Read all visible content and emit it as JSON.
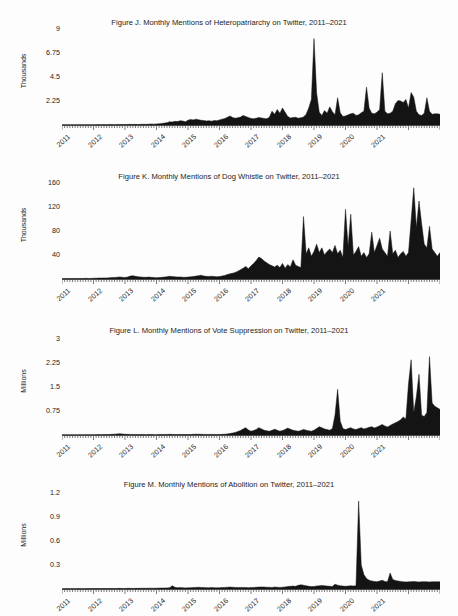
{
  "page": {
    "background": "#fdfdfd",
    "ink": "#1a1a1a",
    "series_fill": "#141414"
  },
  "figures": [
    {
      "id": "figure-j",
      "title": "Figure J. Monthly Mentions of Heteropatriarchy on Twitter, 2011–2021",
      "ylabel": "Thousands",
      "yticks": [
        "9",
        "6.75",
        "4.5",
        "2.25"
      ],
      "xticks": [
        "2011",
        "2012",
        "2013",
        "2014",
        "2015",
        "2016",
        "2017",
        "2018",
        "2019",
        "2020",
        "2021"
      ]
    },
    {
      "id": "figure-k",
      "title": "Figure K. Monthly Mentions of Dog Whistle on Twitter, 2011–2021",
      "ylabel": "Thousands",
      "yticks": [
        "160",
        "120",
        "80",
        "40"
      ],
      "xticks": [
        "2011",
        "2012",
        "2013",
        "2014",
        "2015",
        "2016",
        "2017",
        "2018",
        "2019",
        "2020",
        "2021"
      ]
    },
    {
      "id": "figure-l",
      "title": "Figure L. Monthly Mentions of Vote Suppression on Twitter, 2011–2021",
      "ylabel": "Millions",
      "yticks": [
        "3",
        "2.25",
        "1.5",
        "0.75"
      ],
      "xticks": [
        "2011",
        "2012",
        "2013",
        "2014",
        "2015",
        "2016",
        "2017",
        "2018",
        "2019",
        "2020",
        "2021"
      ]
    },
    {
      "id": "figure-m",
      "title": "Figure M. Monthly Mentions of Abolition on Twitter, 2011–2021",
      "ylabel": "Millions",
      "yticks": [
        "1.2",
        "0.9",
        "0.6",
        "0.3"
      ],
      "xticks": [
        "2011",
        "2012",
        "2013",
        "2014",
        "2015",
        "2016",
        "2017",
        "2018",
        "2019",
        "2020",
        "2021"
      ]
    }
  ],
  "chart_data": [
    {
      "type": "area",
      "title": "Figure J. Monthly Mentions of Heteropatriarchy on Twitter, 2011–2021",
      "xlabel": "",
      "ylabel": "Thousands",
      "ylim": [
        0,
        9
      ],
      "yticks": [
        2.25,
        4.5,
        6.75,
        9
      ],
      "grid": false,
      "legend": "none",
      "x_start": "2011-01",
      "x_end": "2021-08",
      "x_tick_labels": [
        "2011",
        "2012",
        "2013",
        "2014",
        "2015",
        "2016",
        "2017",
        "2018",
        "2019",
        "2020",
        "2021"
      ],
      "units": "thousands of mentions per month",
      "values": [
        0.02,
        0.02,
        0.03,
        0.02,
        0.03,
        0.02,
        0.03,
        0.03,
        0.02,
        0.03,
        0.03,
        0.02,
        0.03,
        0.03,
        0.04,
        0.03,
        0.04,
        0.03,
        0.04,
        0.04,
        0.03,
        0.04,
        0.05,
        0.04,
        0.05,
        0.05,
        0.06,
        0.05,
        0.06,
        0.05,
        0.06,
        0.07,
        0.06,
        0.08,
        0.09,
        0.08,
        0.1,
        0.12,
        0.14,
        0.18,
        0.22,
        0.3,
        0.28,
        0.34,
        0.32,
        0.4,
        0.38,
        0.3,
        0.45,
        0.52,
        0.48,
        0.55,
        0.5,
        0.44,
        0.42,
        0.38,
        0.4,
        0.36,
        0.42,
        0.4,
        0.48,
        0.55,
        0.6,
        0.72,
        0.85,
        0.7,
        0.64,
        0.68,
        0.74,
        0.9,
        0.8,
        0.7,
        0.62,
        0.58,
        0.64,
        0.7,
        0.66,
        0.62,
        0.58,
        0.72,
        1.3,
        1.0,
        1.45,
        1.1,
        1.6,
        1.2,
        0.8,
        0.66,
        0.7,
        0.72,
        0.64,
        0.68,
        0.74,
        1.0,
        1.6,
        2.4,
        8.1,
        3.0,
        1.2,
        0.9,
        1.35,
        1.1,
        1.7,
        1.25,
        0.95,
        2.55,
        1.15,
        0.8,
        0.85,
        0.95,
        1.05,
        1.1,
        0.9,
        0.95,
        1.15,
        1.3,
        3.55,
        1.6,
        1.1,
        1.05,
        1.2,
        1.45,
        4.9,
        1.3,
        1.05,
        1.1,
        1.3,
        2.0,
        2.3,
        2.25,
        2.1,
        2.4,
        1.6,
        3.05,
        2.6,
        1.3,
        0.95,
        0.9,
        1.1,
        2.55,
        1.3,
        1.0,
        1.05,
        1.05,
        1.0
      ]
    },
    {
      "type": "area",
      "title": "Figure K. Monthly Mentions of Dog Whistle on Twitter, 2011–2021",
      "xlabel": "",
      "ylabel": "Thousands",
      "ylim": [
        0,
        160
      ],
      "yticks": [
        40,
        80,
        120,
        160
      ],
      "grid": false,
      "legend": "none",
      "x_start": "2011-01",
      "x_end": "2021-08",
      "x_tick_labels": [
        "2011",
        "2012",
        "2013",
        "2014",
        "2015",
        "2016",
        "2017",
        "2018",
        "2019",
        "2020",
        "2021"
      ],
      "units": "thousands of mentions per month",
      "values": [
        0.6,
        0.7,
        0.8,
        0.7,
        0.9,
        0.8,
        0.9,
        1.0,
        0.9,
        1.1,
        1.0,
        0.9,
        1.2,
        1.4,
        1.6,
        1.5,
        1.8,
        1.6,
        2.0,
        2.4,
        2.6,
        3.0,
        3.4,
        2.8,
        2.6,
        3.2,
        4.8,
        5.6,
        4.4,
        3.8,
        3.4,
        3.0,
        2.8,
        3.2,
        2.8,
        2.4,
        2.2,
        2.4,
        2.8,
        3.2,
        3.8,
        4.6,
        4.0,
        3.6,
        3.2,
        3.4,
        3.0,
        2.8,
        3.2,
        3.6,
        4.2,
        4.8,
        5.6,
        6.2,
        5.0,
        4.4,
        4.2,
        4.6,
        4.2,
        3.8,
        4.2,
        5.0,
        6.0,
        7.4,
        8.6,
        9.6,
        11.0,
        13.0,
        15.5,
        18.0,
        21.0,
        17.0,
        22.0,
        26.0,
        31.0,
        36.5,
        34.0,
        30.0,
        27.0,
        24.0,
        22.0,
        20.0,
        23.0,
        19.0,
        26.0,
        18.0,
        24.0,
        20.0,
        32.0,
        23.0,
        21.0,
        19.0,
        104.0,
        42.0,
        52.0,
        38.0,
        46.0,
        58.0,
        44.0,
        52.0,
        40.0,
        46.0,
        50.0,
        44.0,
        56.0,
        42.0,
        48.0,
        36.0,
        116.0,
        54.0,
        108.0,
        40.0,
        46.0,
        54.0,
        38.0,
        44.0,
        36.0,
        42.0,
        78.0,
        44.0,
        56.0,
        68.0,
        50.0,
        44.0,
        38.0,
        80.0,
        42.0,
        48.0,
        36.0,
        42.0,
        46.0,
        38.0,
        44.0,
        98.0,
        152.0,
        86.0,
        130.0,
        92.0,
        58.0,
        52.0,
        88.0,
        50.0,
        44.0,
        38.0,
        44.0
      ]
    },
    {
      "type": "area",
      "title": "Figure L. Monthly Mentions of Vote Suppression on Twitter, 2011–2021",
      "xlabel": "",
      "ylabel": "Millions",
      "ylim": [
        0,
        3
      ],
      "yticks": [
        0.75,
        1.5,
        2.25,
        3
      ],
      "grid": false,
      "legend": "none",
      "x_start": "2011-01",
      "x_end": "2021-08",
      "x_tick_labels": [
        "2011",
        "2012",
        "2013",
        "2014",
        "2015",
        "2016",
        "2017",
        "2018",
        "2019",
        "2020",
        "2021"
      ],
      "units": "millions of mentions per month",
      "values": [
        0.004,
        0.005,
        0.006,
        0.005,
        0.006,
        0.005,
        0.006,
        0.007,
        0.006,
        0.008,
        0.009,
        0.007,
        0.008,
        0.01,
        0.012,
        0.011,
        0.013,
        0.012,
        0.016,
        0.02,
        0.026,
        0.034,
        0.04,
        0.03,
        0.024,
        0.02,
        0.018,
        0.016,
        0.014,
        0.013,
        0.012,
        0.012,
        0.011,
        0.014,
        0.012,
        0.01,
        0.011,
        0.012,
        0.014,
        0.016,
        0.018,
        0.02,
        0.017,
        0.015,
        0.014,
        0.016,
        0.014,
        0.012,
        0.014,
        0.016,
        0.02,
        0.026,
        0.024,
        0.021,
        0.019,
        0.018,
        0.016,
        0.018,
        0.016,
        0.014,
        0.016,
        0.02,
        0.026,
        0.034,
        0.046,
        0.06,
        0.08,
        0.11,
        0.14,
        0.19,
        0.23,
        0.16,
        0.12,
        0.14,
        0.175,
        0.23,
        0.19,
        0.15,
        0.13,
        0.12,
        0.145,
        0.18,
        0.15,
        0.12,
        0.14,
        0.175,
        0.215,
        0.18,
        0.15,
        0.13,
        0.12,
        0.14,
        0.175,
        0.15,
        0.13,
        0.12,
        0.15,
        0.2,
        0.26,
        0.23,
        0.19,
        0.17,
        0.15,
        0.2,
        0.62,
        1.43,
        0.43,
        0.2,
        0.17,
        0.2,
        0.23,
        0.19,
        0.17,
        0.2,
        0.23,
        0.19,
        0.21,
        0.24,
        0.26,
        0.22,
        0.25,
        0.29,
        0.33,
        0.28,
        0.25,
        0.3,
        0.34,
        0.38,
        0.42,
        0.48,
        0.56,
        0.5,
        1.6,
        2.35,
        0.7,
        1.2,
        1.9,
        0.62,
        0.58,
        0.7,
        2.45,
        1.0,
        0.9,
        0.85,
        0.8
      ]
    },
    {
      "type": "area",
      "title": "Figure M. Monthly Mentions of Abolition on Twitter, 2011–2021",
      "xlabel": "",
      "ylabel": "Millions",
      "ylim": [
        0,
        1.2
      ],
      "yticks": [
        0.3,
        0.6,
        0.9,
        1.2
      ],
      "grid": false,
      "legend": "none",
      "x_start": "2011-01",
      "x_end": "2021-08",
      "x_tick_labels": [
        "2011",
        "2012",
        "2013",
        "2014",
        "2015",
        "2016",
        "2017",
        "2018",
        "2019",
        "2020",
        "2021"
      ],
      "units": "millions of mentions per month",
      "values": [
        0.004,
        0.004,
        0.005,
        0.004,
        0.005,
        0.004,
        0.005,
        0.005,
        0.004,
        0.005,
        0.006,
        0.005,
        0.005,
        0.006,
        0.006,
        0.005,
        0.006,
        0.006,
        0.007,
        0.007,
        0.006,
        0.007,
        0.008,
        0.006,
        0.007,
        0.008,
        0.008,
        0.007,
        0.008,
        0.008,
        0.009,
        0.009,
        0.008,
        0.01,
        0.01,
        0.009,
        0.01,
        0.011,
        0.012,
        0.013,
        0.014,
        0.016,
        0.04,
        0.022,
        0.016,
        0.018,
        0.016,
        0.014,
        0.015,
        0.016,
        0.018,
        0.02,
        0.022,
        0.02,
        0.018,
        0.017,
        0.016,
        0.018,
        0.016,
        0.015,
        0.016,
        0.018,
        0.02,
        0.022,
        0.024,
        0.022,
        0.02,
        0.019,
        0.018,
        0.02,
        0.019,
        0.017,
        0.018,
        0.02,
        0.022,
        0.024,
        0.026,
        0.024,
        0.022,
        0.021,
        0.02,
        0.024,
        0.022,
        0.02,
        0.022,
        0.026,
        0.03,
        0.034,
        0.036,
        0.034,
        0.046,
        0.052,
        0.048,
        0.04,
        0.034,
        0.03,
        0.032,
        0.036,
        0.04,
        0.044,
        0.04,
        0.036,
        0.034,
        0.032,
        0.06,
        0.048,
        0.04,
        0.036,
        0.034,
        0.036,
        0.04,
        0.038,
        0.042,
        1.1,
        0.3,
        0.18,
        0.13,
        0.11,
        0.1,
        0.095,
        0.09,
        0.1,
        0.11,
        0.095,
        0.09,
        0.2,
        0.12,
        0.105,
        0.1,
        0.095,
        0.09,
        0.088,
        0.09,
        0.092,
        0.095,
        0.09,
        0.088,
        0.09,
        0.092,
        0.09,
        0.088,
        0.09,
        0.092,
        0.09,
        0.09
      ]
    }
  ]
}
